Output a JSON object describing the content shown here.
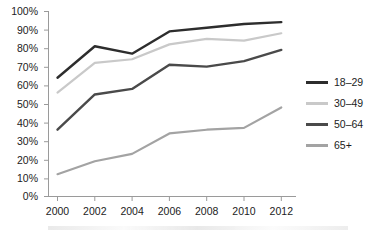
{
  "chart_data": {
    "type": "line",
    "title": "",
    "subtitle": "",
    "xlabel": "",
    "ylabel": "",
    "x": [
      2000,
      2002,
      2004,
      2006,
      2008,
      2010,
      2012
    ],
    "categories": [
      "2000",
      "2002",
      "2004",
      "2006",
      "2008",
      "2010",
      "2012"
    ],
    "xtick_labels": [
      "2000",
      "2002",
      "2004",
      "2006",
      "2008",
      "2010",
      "2012"
    ],
    "ytick_labels": [
      "0%",
      "10%",
      "20%",
      "30%",
      "40%",
      "50%",
      "60%",
      "70%",
      "80%",
      "90%",
      "100%"
    ],
    "ytick_values": [
      0,
      10,
      20,
      30,
      40,
      50,
      60,
      70,
      80,
      90,
      100
    ],
    "ylim": [
      0,
      100
    ],
    "xlim": [
      2000,
      2012
    ],
    "grid": false,
    "legend_position": "right",
    "series": [
      {
        "name": "18–29",
        "color": "#2d2d2d",
        "values": [
          64,
          81,
          77,
          89,
          91,
          93,
          94
        ]
      },
      {
        "name": "30–49",
        "color": "#c9c9c9",
        "values": [
          56,
          72,
          74,
          82,
          85,
          84,
          88
        ]
      },
      {
        "name": "50–64",
        "color": "#4a4a4a",
        "values": [
          36,
          55,
          58,
          71,
          70,
          73,
          79
        ]
      },
      {
        "name": "65+",
        "color": "#a3a3a3",
        "values": [
          12,
          19,
          23,
          34,
          36,
          37,
          48
        ]
      }
    ]
  },
  "legend": {
    "items": [
      {
        "label": "18–29",
        "color": "#2d2d2d"
      },
      {
        "label": "30–49",
        "color": "#c9c9c9"
      },
      {
        "label": "50–64",
        "color": "#4a4a4a"
      },
      {
        "label": "65+",
        "color": "#a3a3a3"
      }
    ]
  },
  "axes": {
    "y_labels": [
      "100%",
      "90%",
      "80%",
      "70%",
      "60%",
      "50%",
      "40%",
      "30%",
      "20%",
      "10%",
      "0%"
    ],
    "x_labels": [
      "2000",
      "2002",
      "2004",
      "2006",
      "2008",
      "2010",
      "2012"
    ]
  }
}
